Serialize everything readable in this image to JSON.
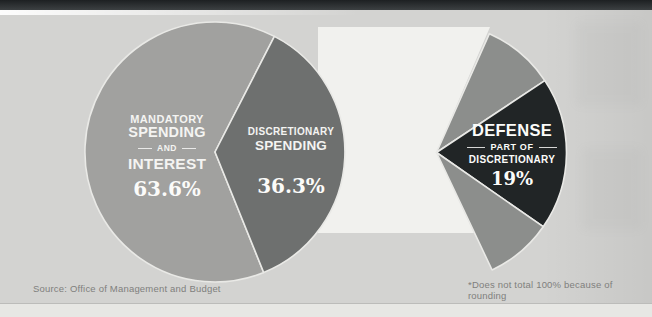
{
  "page": {
    "background": "#d3d3d1",
    "top_bar_color": "#2c2f31",
    "backdrop_color": "#f1f1ee",
    "separator_color": "#e9e9e6",
    "source_note": "Source: Office of Management and Budget",
    "footnote": "*Does not total 100% because of rounding"
  },
  "chart_data": [
    {
      "type": "pie",
      "name": "federal-budget-pie",
      "partial": false,
      "start_angle_deg": -68,
      "slices": [
        {
          "label": "MANDATORY SPENDING AND INTEREST",
          "value": 63.6,
          "color": "#a1a19f"
        },
        {
          "label": "DISCRETIONARY SPENDING",
          "value": 36.3,
          "color": "#6e706f"
        }
      ]
    },
    {
      "type": "pie",
      "name": "defense-share-wedge",
      "partial": true,
      "start_angle_deg": 66,
      "slices": [
        {
          "label": "NON-DEFENSE DISCRETIONARY (upper)",
          "value": 9.0,
          "color": "#8c8e8c"
        },
        {
          "label": "DEFENSE PART OF DISCRETIONARY",
          "value": 19.0,
          "color": "#212526"
        },
        {
          "label": "NON-DEFENSE DISCRETIONARY (lower)",
          "value": 8.3,
          "color": "#8c8e8c"
        }
      ]
    }
  ],
  "labels": {
    "mandatory": {
      "line1": "MANDATORY",
      "line2": "SPENDING",
      "line3": "AND",
      "line4": "INTEREST",
      "pct": "63.6%"
    },
    "discretionary": {
      "line1": "DISCRETIONARY",
      "line2": "SPENDING",
      "pct": "36.3%"
    },
    "defense": {
      "line1": "DEFENSE",
      "line2": "PART OF",
      "line3": "DISCRETIONARY",
      "pct": "19%"
    }
  }
}
